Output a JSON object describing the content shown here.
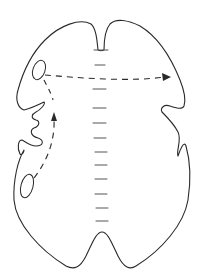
{
  "diagram": {
    "type": "line-drawing",
    "colors": {
      "background": "#ffffff",
      "stroke": "#2a2a2a",
      "midline": "#555555"
    },
    "elements": {
      "outline": "body-outline",
      "midline_dashes": 13,
      "ovals": [
        "upper-left-oval",
        "lower-left-oval"
      ],
      "arrows": [
        {
          "name": "horizontal-arrow",
          "from": "upper-left-oval",
          "to": "right-side",
          "style": "dashed"
        },
        {
          "name": "vertical-arrow",
          "from": "lower-left-oval",
          "to": "upper-left-oval",
          "style": "dashed"
        }
      ]
    },
    "text_labels": []
  }
}
